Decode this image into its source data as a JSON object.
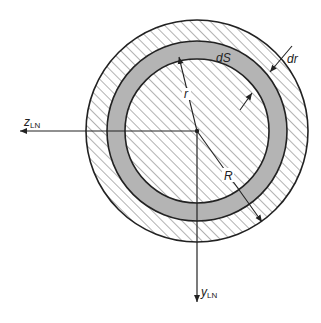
{
  "diagram": {
    "title": "",
    "labels": {
      "z_axis": "z",
      "z_axis_sub": "LN",
      "y_axis": "y",
      "y_axis_sub": "LN",
      "radius_inner": "r",
      "radius_outer": "R",
      "ring_area": "dS",
      "ring_width": "dr"
    },
    "geometry": {
      "center": [
        197,
        131
      ],
      "outer_radius": 111,
      "ring_outer_radius": 90,
      "ring_inner_radius": 72
    },
    "colors": {
      "ring_fill": "#b4b4b4",
      "stroke": "#222222",
      "hatch": "#555555",
      "background": "#ffffff"
    }
  }
}
